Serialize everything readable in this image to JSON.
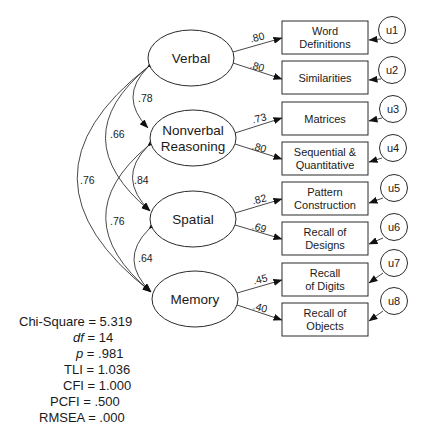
{
  "latent_factors": [
    {
      "id": "verbal",
      "lines": [
        "Verbal"
      ]
    },
    {
      "id": "nonverbal",
      "lines": [
        "Nonverbal",
        "Reasoning"
      ]
    },
    {
      "id": "spatial",
      "lines": [
        "Spatial"
      ]
    },
    {
      "id": "memory",
      "lines": [
        "Memory"
      ]
    }
  ],
  "indicators": [
    {
      "lines": [
        "Word",
        "Definitions"
      ],
      "loading": ".80",
      "error": "u1"
    },
    {
      "lines": [
        "Similarities"
      ],
      "loading": ".80",
      "error": "u2"
    },
    {
      "lines": [
        "Matrices"
      ],
      "loading": ".73",
      "error": "u3"
    },
    {
      "lines": [
        "Sequential &",
        "Quantitative"
      ],
      "loading": ".80",
      "error": "u4"
    },
    {
      "lines": [
        "Pattern",
        "Construction"
      ],
      "loading": ".82",
      "error": "u5"
    },
    {
      "lines": [
        "Recall of",
        "Designs"
      ],
      "loading": ".69",
      "error": "u6"
    },
    {
      "lines": [
        "Recall",
        "of Digits"
      ],
      "loading": ".45",
      "error": "u7"
    },
    {
      "lines": [
        "Recall of",
        "Objects"
      ],
      "loading": ".40",
      "error": "u8"
    }
  ],
  "correlations": {
    "verbal_nonverbal": ".78",
    "verbal_spatial": ".66",
    "verbal_memory": ".76",
    "nonverbal_spatial": ".84",
    "nonverbal_memory": ".76",
    "spatial_memory": ".64"
  },
  "fit_statistics": {
    "chi_square": {
      "label": "Chi-Square",
      "value": "= 5.319"
    },
    "df": {
      "label": "df",
      "value": "= 14"
    },
    "p": {
      "label": "p",
      "value": "= .981"
    },
    "tli": {
      "label": "TLI",
      "value": "= 1.036"
    },
    "cfi": {
      "label": "CFI",
      "value": "= 1.000"
    },
    "pcfi": {
      "label": "PCFI",
      "value": "= .500"
    },
    "rmsea": {
      "label": "RMSEA",
      "value": "= .000"
    }
  }
}
